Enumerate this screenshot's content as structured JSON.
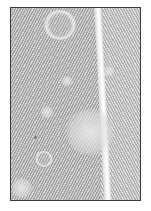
{
  "image": {
    "subject": "feather close-up",
    "description": "Grayscale photograph of a feather vane with a white central shaft and several pale circular spots, inside a thin dark frame on white background",
    "colors": {
      "background": "#ffffff",
      "frame_border": "#3a3a3a",
      "vane": "#bdbdbd",
      "shaft": "#f6f6f6"
    }
  }
}
